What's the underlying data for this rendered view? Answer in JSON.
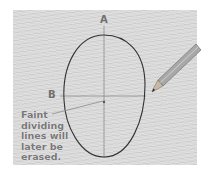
{
  "illustration": {
    "subject": "oval face outline with guide lines",
    "labels": {
      "vertical_axis": "A",
      "horizontal_axis": "B"
    },
    "caption_lines": [
      "Faint",
      "dividing",
      "lines will",
      "later be",
      "erased."
    ],
    "colors": {
      "paper": "#d9d9d9",
      "line": "#3a3a3a",
      "guide": "#777777",
      "caption": "#777777"
    },
    "icons": [
      "pencil-icon"
    ]
  }
}
